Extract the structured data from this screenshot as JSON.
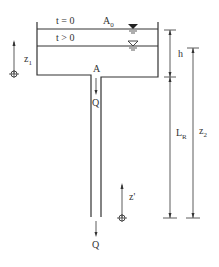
{
  "diagram": {
    "labels": {
      "t0": "t = 0",
      "tpos": "t > 0",
      "area_main": "A",
      "area_sub": "0",
      "pipe_area": "A",
      "flow_upper": "Q",
      "flow_lower": "Q",
      "z1_main": "z",
      "z1_sub": "1",
      "h": "h",
      "LR_main": "L",
      "LR_sub": "R",
      "z2_main": "z",
      "z2_sub": "2",
      "zprime": "z'"
    },
    "colors": {
      "line": "#333333",
      "background": "#ffffff"
    }
  }
}
